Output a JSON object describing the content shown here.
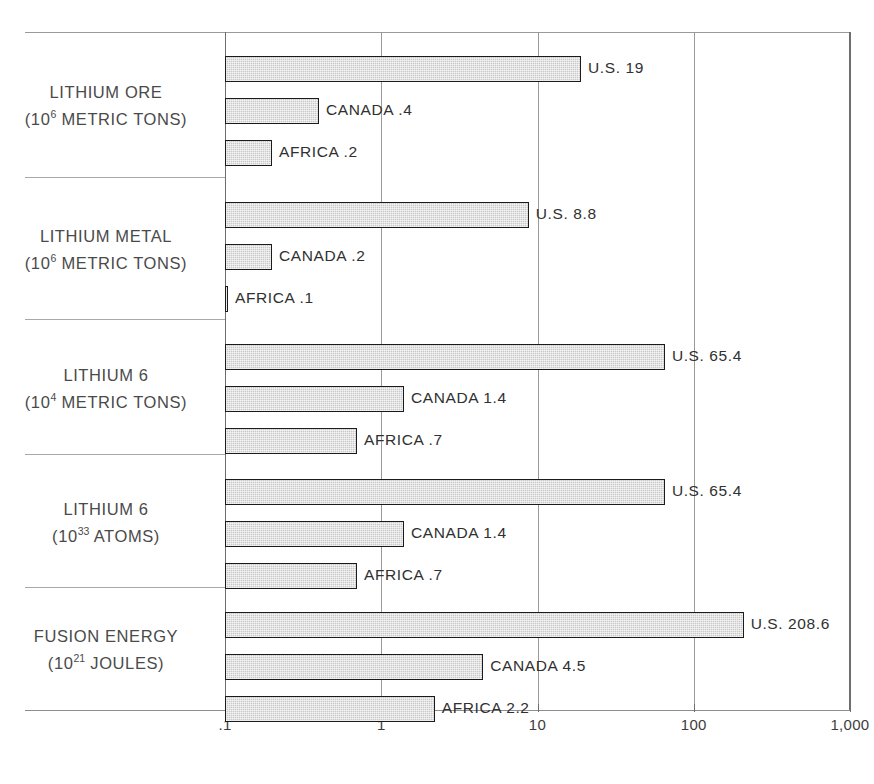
{
  "chart_data": {
    "type": "bar",
    "orientation": "horizontal",
    "scale": "log",
    "title": "",
    "subtitle": "",
    "xlabel": "",
    "ylabel": "",
    "grid": true,
    "legend": "none",
    "xlim": [
      0.1,
      1000
    ],
    "axis": {
      "tick_labels": [
        ".1",
        "1",
        "10",
        "100",
        "1,000"
      ],
      "tick_values": [
        0.1,
        1,
        10,
        100,
        1000
      ]
    },
    "groups": [
      {
        "name": "LITHIUM ORE",
        "unit_prefix": "(10",
        "unit_exponent": "6",
        "unit_suffix": " METRIC TONS)",
        "categories": [
          "U.S.",
          "CANADA",
          "AFRICA"
        ],
        "values": [
          19,
          0.4,
          0.2
        ],
        "labels": [
          "U.S. 19",
          "CANADA .4",
          "AFRICA .2"
        ],
        "value_texts": [
          "19",
          ".4",
          ".2"
        ]
      },
      {
        "name": "LITHIUM METAL",
        "unit_prefix": "(10",
        "unit_exponent": "6",
        "unit_suffix": " METRIC TONS)",
        "categories": [
          "U.S.",
          "CANADA",
          "AFRICA"
        ],
        "values": [
          8.8,
          0.2,
          0.1
        ],
        "labels": [
          "U.S. 8.8",
          "CANADA .2",
          "AFRICA .1"
        ],
        "value_texts": [
          "8.8",
          ".2",
          ".1"
        ]
      },
      {
        "name": "LITHIUM 6",
        "unit_prefix": "(10",
        "unit_exponent": "4",
        "unit_suffix": " METRIC TONS)",
        "categories": [
          "U.S.",
          "CANADA",
          "AFRICA"
        ],
        "values": [
          65.4,
          1.4,
          0.7
        ],
        "labels": [
          "U.S. 65.4",
          "CANADA 1.4",
          "AFRICA .7"
        ],
        "value_texts": [
          "65.4",
          "1.4",
          ".7"
        ]
      },
      {
        "name": "LITHIUM 6",
        "unit_prefix": "(10",
        "unit_exponent": "33",
        "unit_suffix": " ATOMS)",
        "categories": [
          "U.S.",
          "CANADA",
          "AFRICA"
        ],
        "values": [
          65.4,
          1.4,
          0.7
        ],
        "labels": [
          "U.S. 65.4",
          "CANADA 1.4",
          "AFRICA .7"
        ],
        "value_texts": [
          "65.4",
          "1.4",
          ".7"
        ]
      },
      {
        "name": "FUSION ENERGY",
        "unit_prefix": "(10",
        "unit_exponent": "21",
        "unit_suffix": " JOULES)",
        "categories": [
          "U.S.",
          "CANADA",
          "AFRICA"
        ],
        "values": [
          208.6,
          4.5,
          2.2
        ],
        "labels": [
          "U.S. 208.6",
          "CANADA 4.5",
          "AFRICA 2.2"
        ],
        "value_texts": [
          "208.6",
          "4.5",
          "2.2"
        ]
      }
    ],
    "colors": {
      "bar_fill": "#c9c9c9",
      "bar_border": "#1b1b1b",
      "gridline": "#9a9a9a",
      "text": "#3a3a3a",
      "background": "#ffffff"
    }
  }
}
